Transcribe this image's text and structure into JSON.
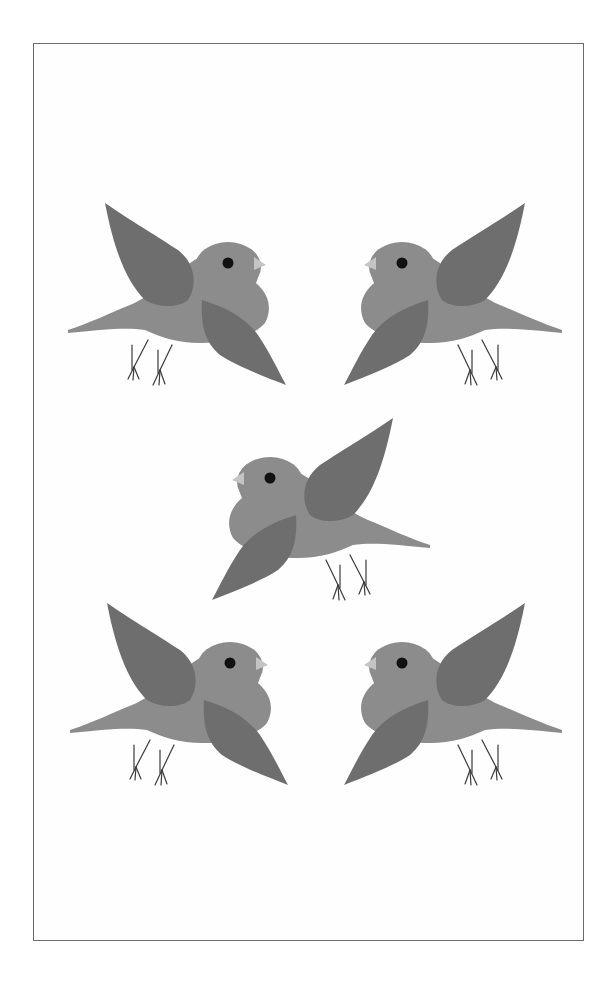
{
  "illustration": {
    "subject": "five gray birds in flight",
    "colors": {
      "background": "#ffffff",
      "frame": "#6a6a6a",
      "body": "#8c8c8c",
      "wing": "#6e6e6e",
      "eye": "#111111",
      "beak": "#c4c4c4",
      "legs": "#3a3a3a"
    },
    "birds": [
      {
        "id": "top-left",
        "facing": "right",
        "x": 60,
        "y": 195
      },
      {
        "id": "top-right",
        "facing": "left",
        "x": 330,
        "y": 195
      },
      {
        "id": "center",
        "facing": "left",
        "x": 198,
        "y": 410
      },
      {
        "id": "bottom-left",
        "facing": "right",
        "x": 62,
        "y": 595
      },
      {
        "id": "bottom-right",
        "facing": "left",
        "x": 330,
        "y": 595
      }
    ]
  }
}
